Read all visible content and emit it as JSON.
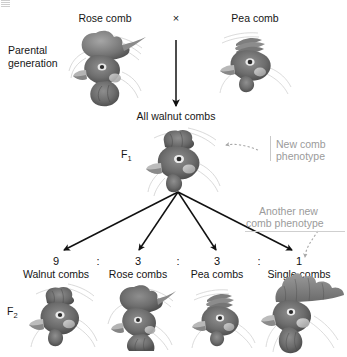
{
  "figure": {
    "title_hidden": "Chicken comb phenotype dihybrid cross",
    "cross_symbol": "×",
    "ratio_separator": ":"
  },
  "generations": {
    "parental": "Parental\ngeneration",
    "parental_line1": "Parental",
    "parental_line2": "generation",
    "f1": "F",
    "f1_sub": "1",
    "f2": "F",
    "f2_sub": "2"
  },
  "parents": [
    {
      "label": "Rose comb",
      "art": "rose-comb-head"
    },
    {
      "label": "Pea comb",
      "art": "pea-comb-head"
    }
  ],
  "f1": {
    "label": "All walnut combs",
    "art": "walnut-comb-head"
  },
  "annotations": [
    {
      "line1": "New comb",
      "line2": "phenotype",
      "color": "#9b9b9b"
    },
    {
      "line1": "Another new",
      "line2": "comb phenotype",
      "color": "#9b9b9b"
    }
  ],
  "f2": {
    "ratio": [
      "9",
      "3",
      "3",
      "1"
    ],
    "separators": [
      ":",
      ":",
      ":"
    ],
    "phenotypes": [
      {
        "label": "Walnut combs",
        "art": "walnut-comb-head"
      },
      {
        "label": "Rose combs",
        "art": "rose-comb-head"
      },
      {
        "label": "Pea combs",
        "art": "pea-comb-head"
      },
      {
        "label": "Single combs",
        "art": "single-comb-head"
      }
    ]
  },
  "colors": {
    "ink": "#161616",
    "annotation_gray": "#9b9b9b",
    "rule_gray": "#c9c9c9",
    "art_dark": "#5b5b5b",
    "art_mid": "#8d8d8d",
    "art_light": "#bdbdbd"
  }
}
